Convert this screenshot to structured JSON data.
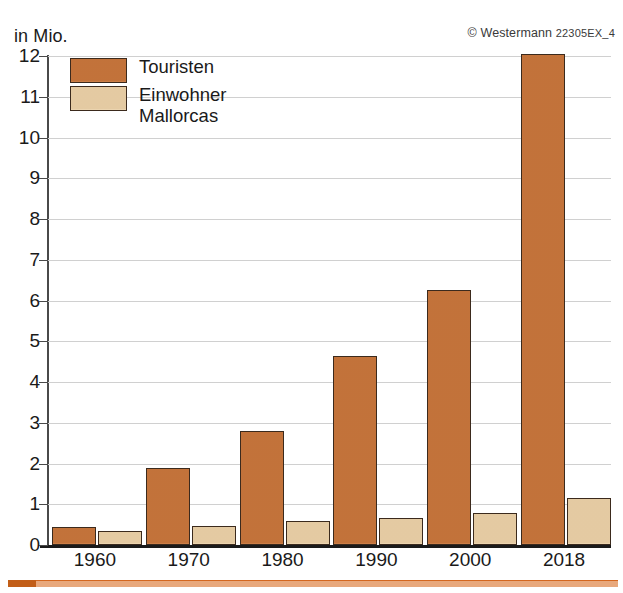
{
  "header": {
    "unit_label": "in Mio.",
    "credit": "© Westermann",
    "credit_code": "22305EX_4"
  },
  "legend": {
    "position": "top-left-inside",
    "entries": [
      {
        "label": "Touristen",
        "color": "#c8763c",
        "name": "tour"
      },
      {
        "label": "Einwohner\nMallorcas",
        "color": "#e9cfa6",
        "name": "inhab"
      }
    ]
  },
  "chart_data": {
    "type": "bar",
    "title": "",
    "subtitle": "",
    "xlabel": "",
    "ylabel": "in Mio.",
    "ylim": [
      0,
      12
    ],
    "ytick_step": 1,
    "yticks": [
      0,
      1,
      2,
      3,
      4,
      5,
      6,
      7,
      8,
      9,
      10,
      11,
      12
    ],
    "ytick_labels": [
      "0",
      "1",
      "2",
      "3",
      "4",
      "5",
      "6",
      "7",
      "8",
      "9",
      "10",
      "11",
      "12"
    ],
    "grid": true,
    "grid_axis": "y",
    "categories": [
      "1960",
      "1970",
      "1980",
      "1990",
      "2000",
      "2018"
    ],
    "series": [
      {
        "name": "Touristen",
        "color": "#c8763c",
        "values": [
          0.45,
          1.9,
          2.8,
          4.65,
          6.25,
          12.05
        ]
      },
      {
        "name": "Einwohner Mallorcas",
        "color": "#e9cfa6",
        "values": [
          0.35,
          0.47,
          0.58,
          0.67,
          0.78,
          1.15
        ]
      }
    ]
  }
}
